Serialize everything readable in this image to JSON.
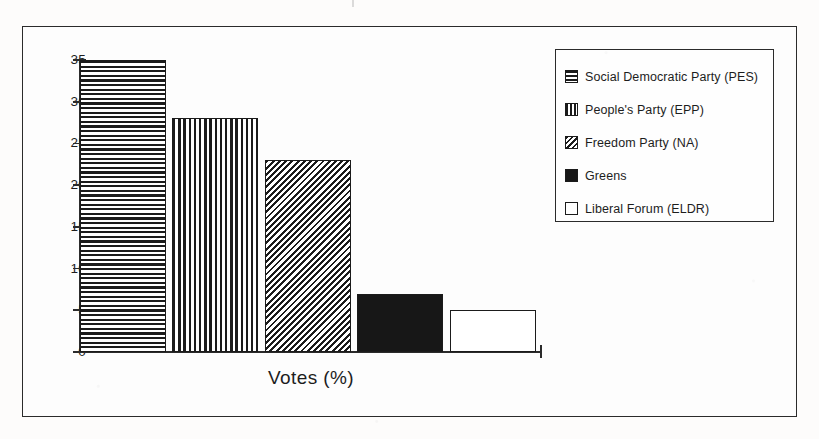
{
  "figure": {
    "background_color": "#fdfdfd",
    "frame_color": "#2b2b2b",
    "ink_color": "#1b1b1b"
  },
  "axis": {
    "y_tick_labels": [
      "35",
      "30",
      "25",
      "20",
      "15",
      "10",
      "5",
      "0"
    ],
    "x_title": "Votes (%)"
  },
  "legend": {
    "items": [
      {
        "label": "Social Democratic Party (PES)",
        "pattern": "horizontal-stripes-swatch"
      },
      {
        "label": "People's Party (EPP)",
        "pattern": "vertical-stripes-swatch"
      },
      {
        "label": "Freedom Party (NA)",
        "pattern": "diagonal-stripes-swatch"
      },
      {
        "label": "Greens",
        "pattern": "solid-black-swatch"
      },
      {
        "label": "Liberal Forum (ELDR)",
        "pattern": "empty-white-swatch"
      }
    ]
  },
  "chart_data": {
    "type": "bar",
    "title": "",
    "xlabel": "Votes (%)",
    "ylabel": "",
    "ylim": [
      0,
      35
    ],
    "yticks": [
      0,
      5,
      10,
      15,
      20,
      25,
      30,
      35
    ],
    "grid": false,
    "legend_position": "top-right",
    "orientation": "vertical",
    "categories": [
      "Social Democratic Party (PES)",
      "People's Party (EPP)",
      "Freedom Party (NA)",
      "Greens",
      "Liberal Forum (ELDR)"
    ],
    "values": [
      35,
      28,
      23,
      7,
      5
    ],
    "fills": [
      "horizontal-stripes",
      "vertical-stripes",
      "diagonal-stripes",
      "solid-black",
      "empty-white"
    ]
  }
}
